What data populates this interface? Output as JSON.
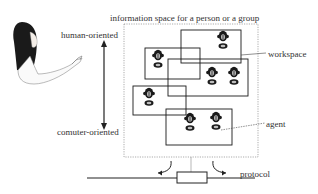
{
  "diagram": {
    "title": "information space for a person or a group",
    "axis": {
      "top_label": "human-oriented",
      "bottom_label": "comuter-oriented"
    },
    "callouts": {
      "workspace": "workspace",
      "agent": "agent",
      "protocol": "protocol"
    },
    "workspaces": [
      {
        "id": "A",
        "agents": 1
      },
      {
        "id": "B",
        "agents": 1
      },
      {
        "id": "C",
        "agents": 2
      },
      {
        "id": "D",
        "agents": 1
      },
      {
        "id": "E",
        "agents": 2
      }
    ],
    "icons": [
      "person-pointing-icon",
      "agent-icon",
      "protocol-connector-icon"
    ]
  }
}
